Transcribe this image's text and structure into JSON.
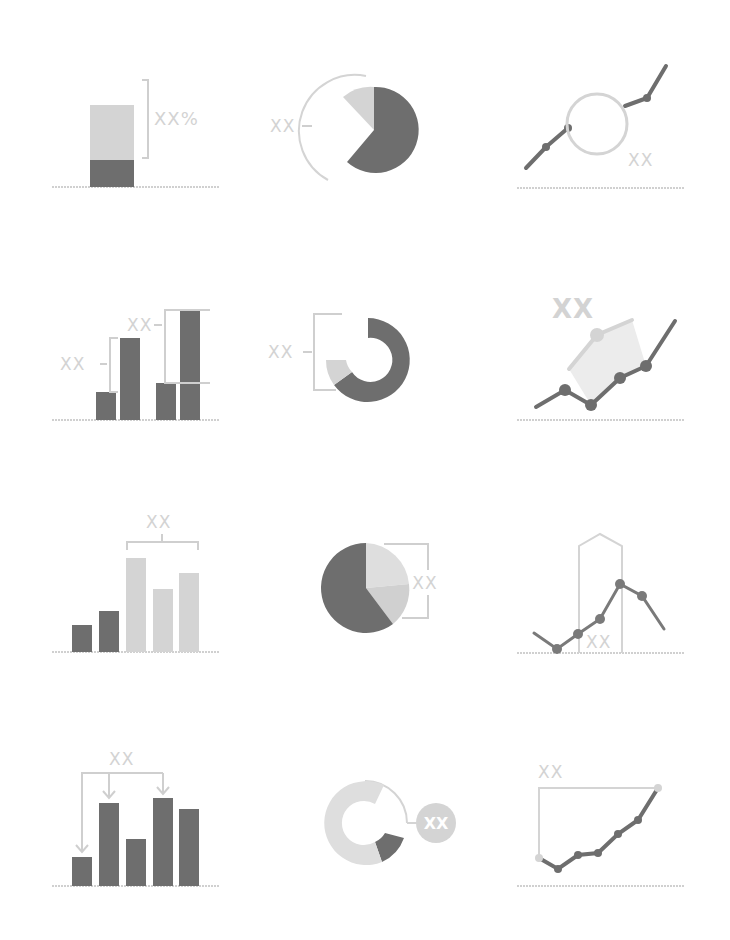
{
  "colors": {
    "dark": "#6e6e6e",
    "light": "#d4d4d4",
    "lighter": "#e2e2e2",
    "line": "#cfcfcf",
    "axis": "#d0d0d0",
    "background": "#ffffff"
  },
  "icons": [
    {
      "id": "stacked-bar-percent",
      "label": "XX%"
    },
    {
      "id": "pie-arc-callout",
      "label": "XX"
    },
    {
      "id": "line-circle-highlight",
      "label": "XX"
    },
    {
      "id": "bar-pairs-difference",
      "label_a": "XX",
      "label_b": "XX"
    },
    {
      "id": "donut-bracket",
      "label": "XX"
    },
    {
      "id": "line-projection",
      "label": "XX"
    },
    {
      "id": "bar-group-bracket",
      "label": "XX"
    },
    {
      "id": "pie-bracket",
      "label": "XX"
    },
    {
      "id": "line-range-highlight",
      "label": "XX"
    },
    {
      "id": "bar-arrows",
      "label": "XX"
    },
    {
      "id": "donut-badge",
      "label": "XX"
    },
    {
      "id": "line-growth-range",
      "label": "XX"
    }
  ]
}
